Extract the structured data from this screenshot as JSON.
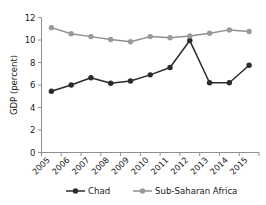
{
  "chart_data": {
    "type": "line",
    "title": "",
    "xlabel": "",
    "ylabel": "GDP (percent)",
    "categories": [
      "2005",
      "2006",
      "2007",
      "2008",
      "2009",
      "2010",
      "2011",
      "2012",
      "2013",
      "2014",
      "2015"
    ],
    "ylim": [
      0,
      12
    ],
    "yticks": [
      0,
      2,
      4,
      6,
      8,
      10,
      12
    ],
    "ytick_labels": [
      "0",
      "2",
      "4",
      "6",
      "8",
      "10",
      "12"
    ],
    "grid": false,
    "legend_position": "bottom",
    "series": [
      {
        "name": "Chad",
        "color": "#2b2b2b",
        "marker": "circle",
        "values": [
          5.45,
          6.0,
          6.65,
          6.15,
          6.35,
          6.9,
          7.55,
          9.95,
          6.2,
          6.2,
          7.75
        ]
      },
      {
        "name": "Sub-Saharan Africa",
        "color": "#9a9a9a",
        "marker": "circle",
        "values": [
          11.1,
          10.55,
          10.3,
          10.05,
          9.85,
          10.3,
          10.2,
          10.35,
          10.6,
          10.9,
          10.75
        ]
      }
    ]
  },
  "legend": {
    "items": [
      {
        "label": "Chad"
      },
      {
        "label": "Sub-Saharan Africa"
      }
    ]
  },
  "axes": {
    "y_axis_label": "GDP (percent)"
  }
}
